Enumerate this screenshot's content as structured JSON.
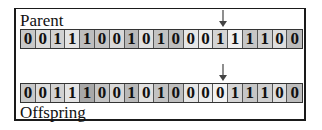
{
  "parent": {
    "label": "Parent",
    "bits": [
      "0",
      "0",
      "1",
      "1",
      "1",
      "0",
      "0",
      "1",
      "0",
      "1",
      "0",
      "0",
      "0",
      "1",
      "1",
      "1",
      "1",
      "0",
      "0"
    ],
    "shades": [
      "#c8c8c8",
      "#dcdcdc",
      "#d2d2d2",
      "#e4e4e4",
      "#bdbdbd",
      "#c4c4c4",
      "#d8d8d8",
      "#b8b8b8",
      "#e0e0e0",
      "#c2c2c2",
      "#bebebe",
      "#e6e6e6",
      "#ececec",
      "#d4d4d4",
      "#f0f0f0",
      "#c6c6c6",
      "#cfcfcf",
      "#dedede",
      "#bcbcbc"
    ]
  },
  "offspring": {
    "label": "Offspring",
    "bits": [
      "0",
      "0",
      "1",
      "1",
      "1",
      "0",
      "0",
      "1",
      "0",
      "1",
      "0",
      "0",
      "0",
      "0",
      "1",
      "1",
      "1",
      "0",
      "0"
    ],
    "shades": [
      "#c8c8c8",
      "#dcdcdc",
      "#d2d2d2",
      "#e4e4e4",
      "#a8a8a8",
      "#c4c4c4",
      "#d8d8d8",
      "#b8b8b8",
      "#e0e0e0",
      "#c2c2c2",
      "#bebebe",
      "#e6e6e6",
      "#ececec",
      "#f2f2f2",
      "#d4d4d4",
      "#c6c6c6",
      "#cfcfcf",
      "#dedede",
      "#bcbcbc"
    ]
  },
  "mutation_point": {
    "index": 13,
    "marker": "arrow-down"
  }
}
